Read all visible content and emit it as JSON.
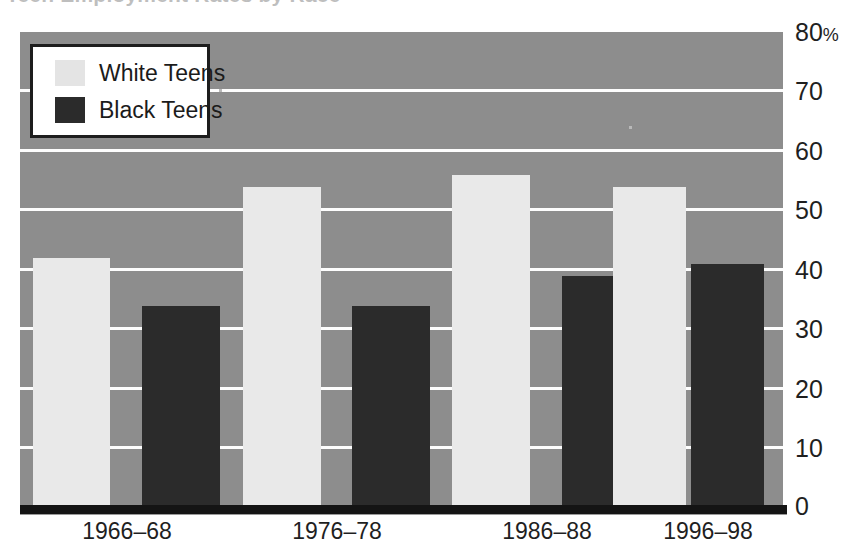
{
  "figure": {
    "title_cropped": "Teen Employment Rates by Race",
    "width": 849,
    "height": 546
  },
  "colors": {
    "plot_background": "#8d8d8d",
    "gridline": "#fdfdfd",
    "white_teens_bar": "#e9e9e9",
    "black_teens_bar": "#2b2b2b",
    "axis": "#141414",
    "text": "#1f1f1f",
    "legend_background": "#ffffff",
    "legend_border": "#1d1d1d"
  },
  "legend": {
    "position": "top-left-inside-plot",
    "entries": [
      {
        "label": "White Teens",
        "swatch": "white"
      },
      {
        "label": "Black Teens",
        "swatch": "black"
      }
    ]
  },
  "axes": {
    "y": {
      "ticks": [
        "0",
        "10",
        "20",
        "30",
        "40",
        "50",
        "60",
        "70",
        "80"
      ],
      "tick_values": [
        0,
        10,
        20,
        30,
        40,
        50,
        60,
        70,
        80
      ],
      "unit_suffix": "%",
      "suffix_on_tick": "80",
      "side": "right",
      "min": 0,
      "max": 80,
      "grid": true
    },
    "x": {
      "ticks": [
        "1966–68",
        "1976–78",
        "1986–88",
        "1996–98"
      ]
    }
  },
  "chart_data": {
    "type": "bar",
    "title": "Teen Employment Rates by Race",
    "xlabel": "",
    "ylabel": "",
    "ylim": [
      0,
      80
    ],
    "grid": true,
    "legend_position": "upper left",
    "categories": [
      "1966–68",
      "1976–78",
      "1986–88",
      "1996–98"
    ],
    "series": [
      {
        "name": "White Teens",
        "color": "#e9e9e9",
        "values": [
          42,
          54,
          56,
          54
        ]
      },
      {
        "name": "Black Teens",
        "color": "#2b2b2b",
        "values": [
          34,
          34,
          39,
          41
        ]
      }
    ]
  }
}
